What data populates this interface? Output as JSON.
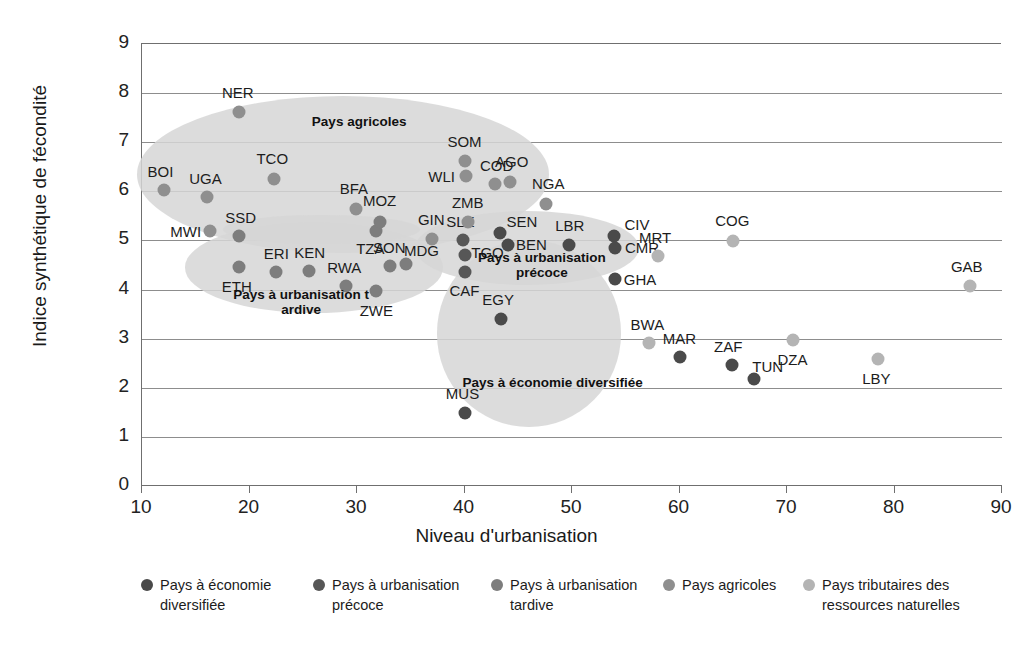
{
  "chart_data": {
    "type": "scatter",
    "title": "",
    "xlabel": "Niveau d'urbanisation",
    "ylabel": "Indice synthétique de fécondité",
    "xlim": [
      10,
      90
    ],
    "ylim": [
      0,
      9
    ],
    "xticks": [
      "10",
      "20",
      "30",
      "40",
      "50",
      "60",
      "70",
      "80",
      "90"
    ],
    "yticks": [
      "0",
      "1",
      "2",
      "3",
      "4",
      "5",
      "6",
      "7",
      "8",
      "9"
    ],
    "grid": "horizontal",
    "legend_position": "bottom",
    "colors": {
      "diversifiee": "#4a4a4a",
      "precoce": "#575757",
      "tardive": "#7d7d7d",
      "agricoles": "#8f8f8f",
      "tributaires": "#b4b4b4",
      "ellipse": "#d6d6d6",
      "gridline": "#8d8d8d",
      "axis": "#6f6f6f",
      "text": "#1a1a1a"
    },
    "series": [
      {
        "name": "Pays à économie diversifiée",
        "color": "#4a4a4a",
        "points": [
          {
            "label": "MUS",
            "x": 40.0,
            "y": 1.48,
            "lx": -2,
            "ly": -20
          },
          {
            "label": "EGY",
            "x": 43.4,
            "y": 3.4,
            "lx": -3,
            "ly": -20
          },
          {
            "label": "MAR",
            "x": 60.0,
            "y": 2.62,
            "lx": 0,
            "ly": -19
          },
          {
            "label": "ZAF",
            "x": 64.9,
            "y": 2.46,
            "lx": -4,
            "ly": -19
          },
          {
            "label": "TUN",
            "x": 66.9,
            "y": 2.18,
            "lx": 14,
            "ly": -13
          },
          {
            "label": "SEN",
            "x": 43.3,
            "y": 5.15,
            "lx": 22,
            "ly": -12
          },
          {
            "label": "BEN",
            "x": 44.0,
            "y": 4.9,
            "lx": 24,
            "ly": -1
          },
          {
            "label": "LBR",
            "x": 49.7,
            "y": 4.9,
            "lx": 1,
            "ly": -20
          },
          {
            "label": "CIV",
            "x": 53.9,
            "y": 5.1,
            "lx": 23,
            "ly": -12
          },
          {
            "label": "CMR",
            "x": 54.0,
            "y": 4.85,
            "lx": 27,
            "ly": -1
          },
          {
            "label": "GHA",
            "x": 54.0,
            "y": 4.22,
            "lx": 25,
            "ly": 0
          }
        ]
      },
      {
        "name": "Pays à urbanisation précoce",
        "color": "#575757",
        "points": [
          {
            "label": "SLE",
            "x": 39.9,
            "y": 5.0,
            "lx": -3,
            "ly": -19
          },
          {
            "label": "TGO",
            "x": 40.0,
            "y": 4.7,
            "lx": 23,
            "ly": -3
          },
          {
            "label": "CAF",
            "x": 40.0,
            "y": 4.35,
            "lx": 0,
            "ly": 18
          }
        ]
      },
      {
        "name": "Pays à urbanisation tardive",
        "color": "#7d7d7d",
        "points": [
          {
            "label": "ETH",
            "x": 19.0,
            "y": 4.45,
            "lx": -2,
            "ly": 19
          },
          {
            "label": "ERI",
            "x": 22.5,
            "y": 4.35,
            "lx": 0,
            "ly": -19
          },
          {
            "label": "KEN",
            "x": 25.5,
            "y": 4.38,
            "lx": 1,
            "ly": -19
          },
          {
            "label": "RWA",
            "x": 29.0,
            "y": 4.08,
            "lx": -2,
            "ly": -19
          },
          {
            "label": "SSD",
            "x": 19.0,
            "y": 5.1,
            "lx": 2,
            "ly": -19
          },
          {
            "label": "TZA",
            "x": 31.8,
            "y": 5.2,
            "lx": -6,
            "ly": 17
          },
          {
            "label": "MOZ",
            "x": 32.1,
            "y": 5.38,
            "lx": 0,
            "ly": -22
          },
          {
            "label": "SON",
            "x": 33.1,
            "y": 4.48,
            "lx": -1,
            "ly": -19
          },
          {
            "label": "MDG",
            "x": 34.6,
            "y": 4.53,
            "lx": 15,
            "ly": -14
          },
          {
            "label": "ZWE",
            "x": 31.8,
            "y": 3.98,
            "lx": 0,
            "ly": 19
          }
        ]
      },
      {
        "name": "Pays agricoles",
        "color": "#8f8f8f",
        "points": [
          {
            "label": "BOI",
            "x": 12.0,
            "y": 6.02,
            "lx": -3,
            "ly": -19
          },
          {
            "label": "UGA",
            "x": 16.0,
            "y": 5.88,
            "lx": -1,
            "ly": -19
          },
          {
            "label": "MWI",
            "x": 16.3,
            "y": 5.2,
            "lx": -24,
            "ly": 0
          },
          {
            "label": "NER",
            "x": 19.0,
            "y": 7.62,
            "lx": -1,
            "ly": -20
          },
          {
            "label": "TCO",
            "x": 22.3,
            "y": 6.25,
            "lx": -2,
            "ly": -21
          },
          {
            "label": "BFA",
            "x": 29.9,
            "y": 5.65,
            "lx": -2,
            "ly": -21
          },
          {
            "label": "GIN",
            "x": 37.0,
            "y": 5.02,
            "lx": -1,
            "ly": -20
          },
          {
            "label": "ZMB",
            "x": 40.3,
            "y": 5.38,
            "lx": 0,
            "ly": -20
          },
          {
            "label": "SOM",
            "x": 40.0,
            "y": 6.62,
            "lx": 0,
            "ly": -20
          },
          {
            "label": "WLI",
            "x": 40.1,
            "y": 6.32,
            "lx": -24,
            "ly": 0
          },
          {
            "label": "COD",
            "x": 42.8,
            "y": 6.15,
            "lx": 2,
            "ly": -19
          },
          {
            "label": "AGO",
            "x": 44.2,
            "y": 6.18,
            "lx": 2,
            "ly": -21
          },
          {
            "label": "NGA",
            "x": 47.6,
            "y": 5.75,
            "lx": 2,
            "ly": -21
          }
        ]
      },
      {
        "name": "Pays tributaires des ressources naturelles",
        "color": "#b4b4b4",
        "points": [
          {
            "label": "MRT",
            "x": 58.0,
            "y": 4.68,
            "lx": -3,
            "ly": -19
          },
          {
            "label": "COG",
            "x": 65.0,
            "y": 4.98,
            "lx": -1,
            "ly": -21
          },
          {
            "label": "GAB",
            "x": 87.0,
            "y": 4.08,
            "lx": -3,
            "ly": -20
          },
          {
            "label": "BWA",
            "x": 57.2,
            "y": 2.92,
            "lx": -2,
            "ly": -19
          },
          {
            "label": "DZA",
            "x": 70.6,
            "y": 2.97,
            "lx": -1,
            "ly": 19
          },
          {
            "label": "LBY",
            "x": 78.5,
            "y": 2.58,
            "lx": -2,
            "ly": 19
          }
        ]
      }
    ],
    "clusters": [
      {
        "name": "Pays agricoles",
        "label": "Pays agricoles",
        "cx": 28.7,
        "cy": 6.35,
        "rx": 19.2,
        "ry": 1.6,
        "label_x": 30.2,
        "label_y": 7.42
      },
      {
        "name": "Pays à urbanisation tardive",
        "label": "Pays à urbanisation t\nardive",
        "cx": 26.0,
        "cy": 4.45,
        "rx": 12.0,
        "ry": 0.92,
        "label_x": 24.8,
        "label_y": 3.73
      },
      {
        "name": "Pays à urbanisation tardive (large)",
        "label": "",
        "cx": 26.7,
        "cy": 5.22,
        "rx": 9.2,
        "ry": 0.3,
        "label_x": 0,
        "label_y": 0
      },
      {
        "name": "Pays à urbanisation précoce",
        "label": "Pays à urbanisation\nprécoce",
        "cx": 45.8,
        "cy": 4.84,
        "rx": 10.4,
        "ry": 0.75,
        "label_x": 47.2,
        "label_y": 4.48
      },
      {
        "name": "Pays à économie diversifiée",
        "label": "Pays à économie diversifiée",
        "cx": 46.0,
        "cy": 3.1,
        "rx": 8.6,
        "ry": 1.9,
        "label_x": 48.2,
        "label_y": 2.1
      }
    ]
  },
  "axes": {
    "x_title": "Niveau d'urbanisation",
    "y_title": "Indice synthétique de fécondité",
    "x_ticks": [
      "10",
      "20",
      "30",
      "40",
      "50",
      "60",
      "70",
      "80",
      "90"
    ],
    "y_ticks": [
      "9",
      "8",
      "7",
      "6",
      "5",
      "4",
      "3",
      "2",
      "1",
      "0"
    ]
  },
  "legend": {
    "items": [
      {
        "label": "Pays à économie\ndiversifiée",
        "color": "#4a4a4a"
      },
      {
        "label": "Pays à urbanisation\nprécoce",
        "color": "#575757"
      },
      {
        "label": "Pays à urbanisation\ntardive",
        "color": "#7d7d7d"
      },
      {
        "label": "Pays agricoles",
        "color": "#8f8f8f"
      },
      {
        "label": "Pays tributaires des\nressources naturelles",
        "color": "#b4b4b4"
      }
    ]
  }
}
